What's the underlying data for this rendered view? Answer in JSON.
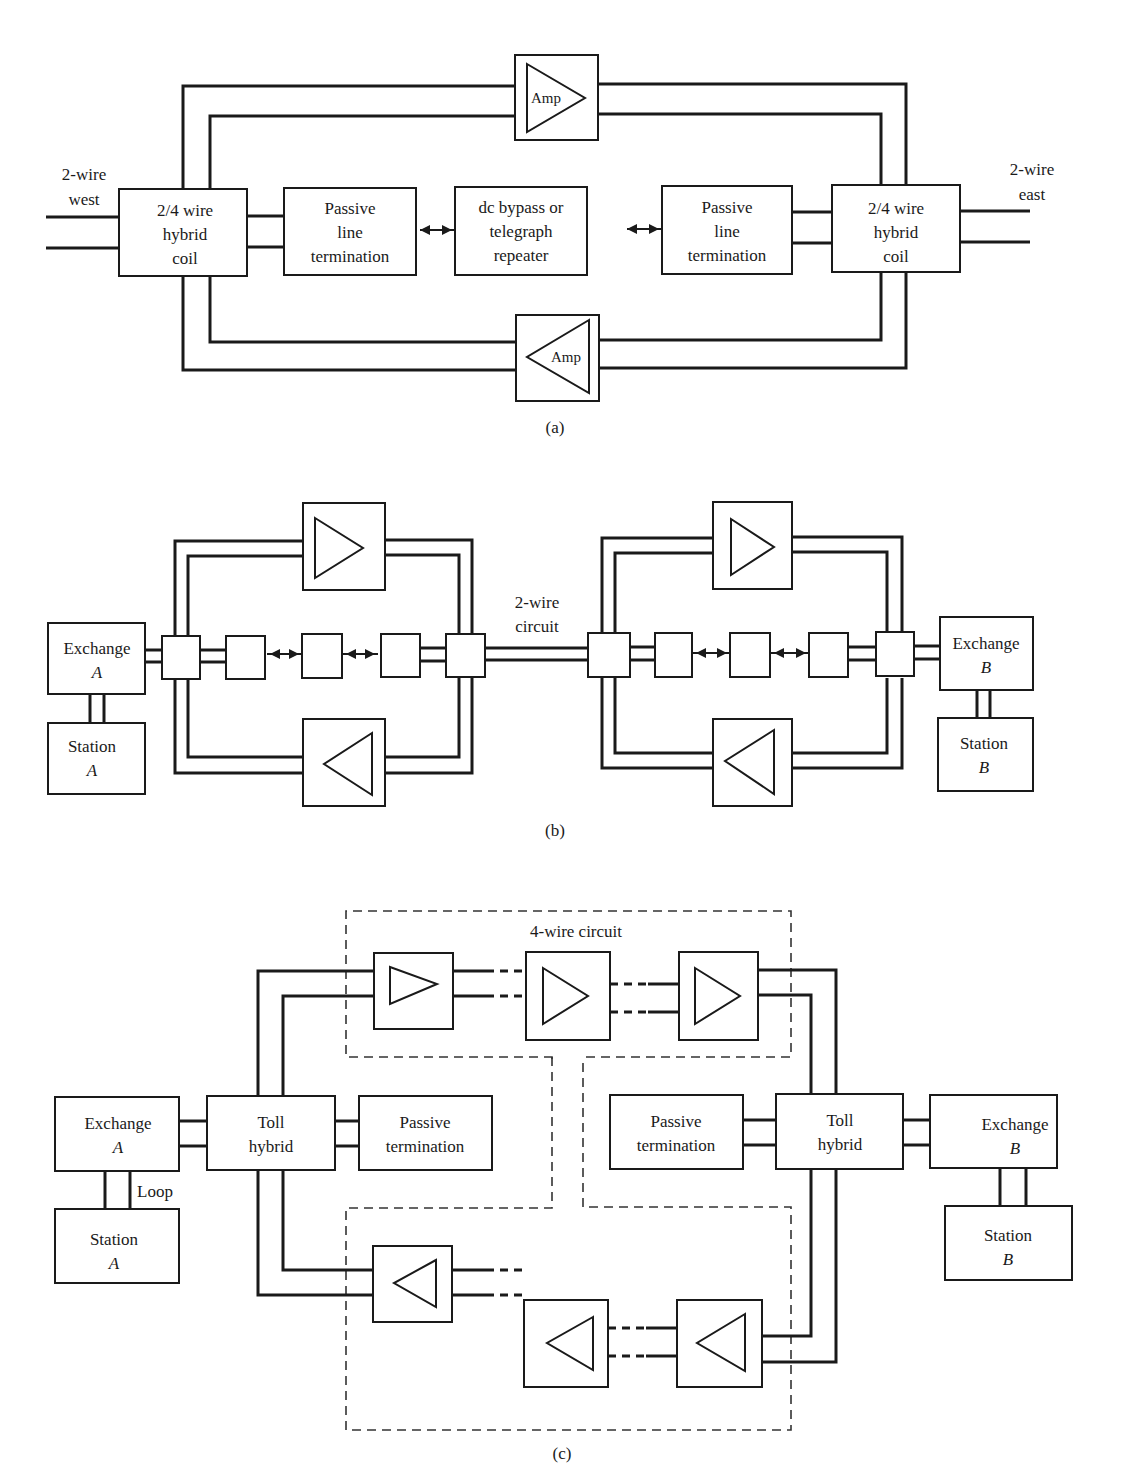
{
  "figure": {
    "panels": [
      {
        "id": "a",
        "caption": "(a)",
        "labels": {
          "west_line1": "2-wire",
          "west_line2": "west",
          "east_line1": "2-wire",
          "east_line2": "east",
          "hybrid_left": [
            "2/4 wire",
            "hybrid",
            "coil"
          ],
          "passive_left": [
            "Passive",
            "line",
            "termination"
          ],
          "center": [
            "dc bypass or",
            "telegraph",
            "repeater"
          ],
          "passive_right": [
            "Passive",
            "line",
            "termination"
          ],
          "hybrid_right": [
            "2/4 wire",
            "hybrid",
            "coil"
          ],
          "amp_top": "Amp",
          "amp_bottom": "Amp"
        }
      },
      {
        "id": "b",
        "caption": "(b)",
        "labels": {
          "exchange_a": [
            "Exchange",
            "A"
          ],
          "station_a": [
            "Station",
            "A"
          ],
          "link": [
            "2-wire",
            "circuit"
          ],
          "exchange_b": [
            "Exchange",
            "B"
          ],
          "station_b": [
            "Station",
            "B"
          ]
        }
      },
      {
        "id": "c",
        "caption": "(c)",
        "labels": {
          "four_wire": "4-wire circuit",
          "exchange_a": [
            "Exchange",
            "A"
          ],
          "loop": "Loop",
          "station_a": [
            "Station",
            "A"
          ],
          "toll_left": [
            "Toll",
            "hybrid"
          ],
          "passive_left": [
            "Passive",
            "termination"
          ],
          "passive_right": [
            "Passive",
            "termination"
          ],
          "toll_right": [
            "Toll",
            "hybrid"
          ],
          "exchange_b": [
            "Exchange",
            "B"
          ],
          "station_b": [
            "Station",
            "B"
          ]
        }
      }
    ],
    "colors": {
      "ink": "#1a1a1a",
      "paper": "#ffffff"
    }
  }
}
